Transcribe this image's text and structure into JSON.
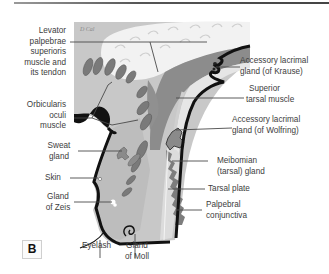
{
  "figure": {
    "panel_label": "B",
    "signature": "D Cal"
  },
  "labels": {
    "levator": [
      "Levator",
      "palpebrae",
      "superioris",
      "muscle and",
      "its tendon"
    ],
    "orbicularis": [
      "Orbicularis",
      "oculi",
      "muscle"
    ],
    "sweat_gland": [
      "Sweat",
      "gland"
    ],
    "skin": "Skin",
    "gland_zeis": [
      "Gland",
      "of Zeis"
    ],
    "eyelash": "Eyelash",
    "gland_moll": [
      "Gland",
      "of Moll"
    ],
    "krause": [
      "Accessory lacrimal",
      "gland (of Krause)"
    ],
    "superior_tarsal": [
      "Superior",
      "tarsal muscle"
    ],
    "wolfring": [
      "Accessory lacrimal",
      "gland (of Wolfring)"
    ],
    "meibomian": [
      "Meibomian",
      "(tarsal) gland"
    ],
    "tarsal_plate": "Tarsal plate",
    "palpebral_conj": [
      "Palpebral",
      "conjunctiva"
    ]
  },
  "colors": {
    "background": "#ffffff",
    "tissue_light": "#c9c9c9",
    "tissue_bg": "#b5b5b5",
    "muscle": "#8a8a8a",
    "dark_outline": "#111111",
    "fat_white": "#eeeeee",
    "leader_line": "#4a4a4a"
  }
}
